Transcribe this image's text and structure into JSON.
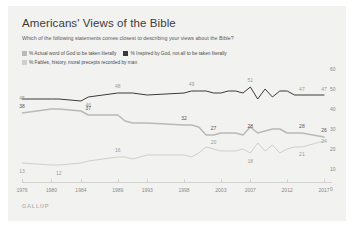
{
  "card": {
    "background": "#f2f2f0"
  },
  "header": {
    "title": "Americans' Views of the Bible",
    "subtitle": "Which of the following statements comes closest to describing your views about the Bible?"
  },
  "footer": {
    "source": "GALLUP"
  },
  "legend": [
    {
      "label": "% Actual word of God to be taken literally",
      "color": "#b9b9b7"
    },
    {
      "label": "% Inspired by God, not all to be taken literally",
      "color": "#3a3a3a"
    },
    {
      "label": "% Fables, history, moral precepts recorded by man",
      "color": "#cfcfcd"
    }
  ],
  "chart_data": {
    "type": "line",
    "title": "Americans' Views of the Bible",
    "subtitle": "Which of the following statements comes closest to describing your views about the Bible?",
    "xlabel": "",
    "ylabel": "",
    "ylim": [
      0,
      60
    ],
    "yticks": [
      0,
      10,
      20,
      30,
      40,
      50,
      60
    ],
    "grid": false,
    "legend_position": "top",
    "xticks": [
      "1976",
      "1980",
      "1984",
      "1989",
      "1993",
      "1998",
      "2003",
      "2007",
      "2012",
      "2017"
    ],
    "x": [
      1976,
      1980,
      1981,
      1984,
      1985,
      1989,
      1990,
      1991,
      1993,
      1998,
      1999,
      2000,
      2001,
      2002,
      2003,
      2004,
      2005,
      2006,
      2007,
      2008,
      2009,
      2010,
      2011,
      2012,
      2013,
      2014,
      2017
    ],
    "series": [
      {
        "name": "% Inspired by God, not all to be taken literally",
        "color": "#3a3a3a",
        "values": [
          45,
          45,
          45,
          44,
          46,
          48,
          48,
          48,
          47,
          48,
          49,
          49,
          49,
          48,
          48,
          49,
          49,
          48,
          51,
          45,
          50,
          46,
          49,
          49,
          47,
          47,
          47
        ],
        "labels": [
          {
            "x": 1976,
            "value": 45
          },
          {
            "x": 1985,
            "value": 46
          },
          {
            "x": 1989,
            "value": 48
          },
          {
            "x": 1999,
            "value": 49
          },
          {
            "x": 2007,
            "value": 51
          },
          {
            "x": 2014,
            "value": 47
          },
          {
            "x": 2017,
            "value": 47
          }
        ]
      },
      {
        "name": "% Actual word of God to be taken literally",
        "color": "#b9b9b7",
        "values": [
          38,
          40,
          40,
          39,
          37,
          37,
          34,
          33,
          33,
          32,
          32,
          31,
          27,
          27,
          28,
          28,
          28,
          27,
          31,
          28,
          29,
          30,
          30,
          28,
          28,
          28,
          26
        ],
        "labels": [
          {
            "x": 1976,
            "value": 38
          },
          {
            "x": 1985,
            "value": 37
          },
          {
            "x": 1998,
            "value": 32
          },
          {
            "x": 2002,
            "value": 27
          },
          {
            "x": 2007,
            "value": 28
          },
          {
            "x": 2014,
            "value": 28
          },
          {
            "x": 2017,
            "value": 26
          }
        ]
      },
      {
        "name": "% Fables, history, moral precepts recorded by man",
        "color": "#cfcfcd",
        "values": [
          13,
          12,
          12,
          13,
          14,
          16,
          16,
          15,
          17,
          17,
          16,
          18,
          21,
          20,
          19,
          19,
          19,
          20,
          18,
          23,
          19,
          22,
          18,
          20,
          21,
          21,
          24
        ],
        "labels": [
          {
            "x": 1976,
            "value": 13
          },
          {
            "x": 1981,
            "value": 12
          },
          {
            "x": 1989,
            "value": 16
          },
          {
            "x": 2002,
            "value": 20
          },
          {
            "x": 2007,
            "value": 18
          },
          {
            "x": 2014,
            "value": 21
          },
          {
            "x": 2017,
            "value": 24
          }
        ]
      }
    ]
  }
}
